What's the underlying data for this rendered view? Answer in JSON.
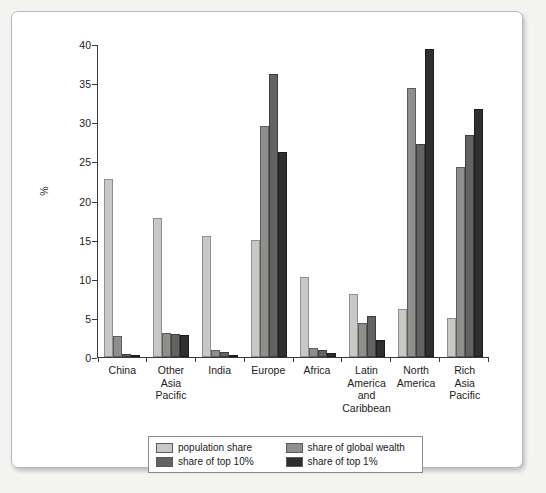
{
  "chart_data": {
    "type": "bar",
    "title": "",
    "subtitle": "",
    "xlabel": "",
    "ylabel": "%",
    "ylim": [
      0,
      40
    ],
    "yticks": [
      0,
      5,
      10,
      15,
      20,
      25,
      30,
      35,
      40
    ],
    "ytick_labels": [
      "0",
      "5",
      "10",
      "15",
      "20",
      "25",
      "30",
      "35",
      "40"
    ],
    "grid": false,
    "legend_position": "bottom",
    "categories": [
      "China",
      "Other Asia Pacific",
      "India",
      "Europe",
      "Africa",
      "Latin America and Caribbean",
      "North America",
      "Rich Asia Pacific"
    ],
    "category_lines": [
      [
        "China"
      ],
      [
        "Other",
        "Asia",
        "Pacific"
      ],
      [
        "India"
      ],
      [
        "Europe"
      ],
      [
        "Africa"
      ],
      [
        "Latin",
        "America",
        "and",
        "Caribbean"
      ],
      [
        "North",
        "America"
      ],
      [
        "Rich",
        "Asia",
        "Pacific"
      ]
    ],
    "series": [
      {
        "name": "population share",
        "color": "#c8c8c6",
        "values": [
          22.8,
          17.8,
          15.5,
          15.0,
          10.2,
          8.1,
          6.2,
          5.0
        ]
      },
      {
        "name": "share of global wealth",
        "color": "#8e8e8c",
        "values": [
          2.7,
          3.1,
          0.9,
          29.5,
          1.2,
          4.3,
          34.4,
          24.3
        ]
      },
      {
        "name": "share of top 10%",
        "color": "#636362",
        "values": [
          0.4,
          3.0,
          0.6,
          36.2,
          0.9,
          5.3,
          27.2,
          28.4
        ]
      },
      {
        "name": "share of top 1%",
        "color": "#2f2f2f",
        "values": [
          0.15,
          2.8,
          0.3,
          26.2,
          0.5,
          2.2,
          39.3,
          31.7
        ]
      }
    ]
  },
  "legend": {
    "items": [
      {
        "label": "population share"
      },
      {
        "label": "share of global wealth"
      },
      {
        "label": "share of top 10%"
      },
      {
        "label": "share of top 1%"
      }
    ]
  }
}
